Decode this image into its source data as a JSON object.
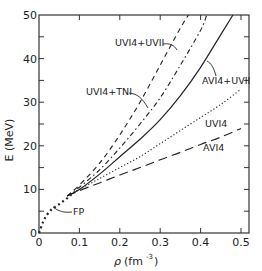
{
  "chart_data": {
    "type": "line",
    "title": "",
    "xlabel": "ρ (fm⁻³)",
    "ylabel": "E (MeV)",
    "xlim": [
      0,
      0.52
    ],
    "ylim": [
      0,
      50
    ],
    "xticks": [
      "0",
      "0.1",
      "0.2",
      "0.3",
      "0.4",
      "0.5"
    ],
    "yticks": [
      "0",
      "10",
      "20",
      "30",
      "40",
      "50"
    ],
    "grid": false,
    "legend": "inline labels with leader arrows",
    "series": [
      {
        "name": "FP",
        "style": "dotted-heavy",
        "x": [
          0.0,
          0.01,
          0.02,
          0.03,
          0.04,
          0.05,
          0.06,
          0.07,
          0.08
        ],
        "y": [
          0.0,
          2.5,
          4.2,
          5.3,
          6.0,
          6.6,
          7.3,
          8.0,
          8.8
        ]
      },
      {
        "name": "UVI4+UVII",
        "style": "dashed",
        "x": [
          0.07,
          0.1,
          0.15,
          0.2,
          0.25,
          0.3,
          0.35,
          0.37
        ],
        "y": [
          8.5,
          11.0,
          16.0,
          22.5,
          30.0,
          38.5,
          47.0,
          50.0
        ]
      },
      {
        "name": "UVI4+TNI",
        "style": "dash-dot",
        "x": [
          0.07,
          0.1,
          0.15,
          0.2,
          0.25,
          0.3,
          0.35,
          0.4,
          0.415
        ],
        "y": [
          8.5,
          10.5,
          14.5,
          19.5,
          25.0,
          31.0,
          38.5,
          46.5,
          50.0
        ]
      },
      {
        "name": "AVI4+UVII",
        "style": "solid",
        "x": [
          0.07,
          0.1,
          0.15,
          0.2,
          0.25,
          0.3,
          0.35,
          0.4,
          0.45,
          0.48
        ],
        "y": [
          8.5,
          10.0,
          13.5,
          17.5,
          21.5,
          26.0,
          31.5,
          38.0,
          45.5,
          50.0
        ]
      },
      {
        "name": "UVI4",
        "style": "dotted",
        "x": [
          0.07,
          0.1,
          0.15,
          0.2,
          0.25,
          0.3,
          0.35,
          0.4,
          0.45,
          0.5
        ],
        "y": [
          8.5,
          10.0,
          12.5,
          15.0,
          17.5,
          20.5,
          23.5,
          26.5,
          29.5,
          33.0
        ]
      },
      {
        "name": "AVI4",
        "style": "long-dashed",
        "x": [
          0.07,
          0.1,
          0.15,
          0.2,
          0.25,
          0.3,
          0.35,
          0.4,
          0.45,
          0.5
        ],
        "y": [
          8.5,
          9.7,
          11.5,
          13.3,
          15.0,
          16.8,
          18.5,
          20.3,
          22.0,
          24.0
        ]
      }
    ],
    "annotations": [
      {
        "text": "UVI4+UVII",
        "target": "UVI4+UVII"
      },
      {
        "text": "UVI4+TNI",
        "target": "UVI4+TNI"
      },
      {
        "text": "AVI4+UVII",
        "target": "AVI4+UVII"
      },
      {
        "text": "UVI4",
        "target": "UVI4"
      },
      {
        "text": "AVI4",
        "target": "AVI4"
      },
      {
        "text": "FP",
        "target": "FP"
      }
    ]
  },
  "axes": {
    "x_title_rho": "ρ",
    "x_title_unit": "(fm",
    "x_title_exp": "-3",
    "x_title_close": ")",
    "y_title": "E (MeV)"
  },
  "labels": {
    "uvi4_uvii": "UVI4+UVII",
    "uvi4_tni": "UVI4+TNI",
    "avi4_uvii": "AVI4+UVII",
    "uvi4": "UVI4",
    "avi4": "AVI4",
    "fp": "FP"
  }
}
